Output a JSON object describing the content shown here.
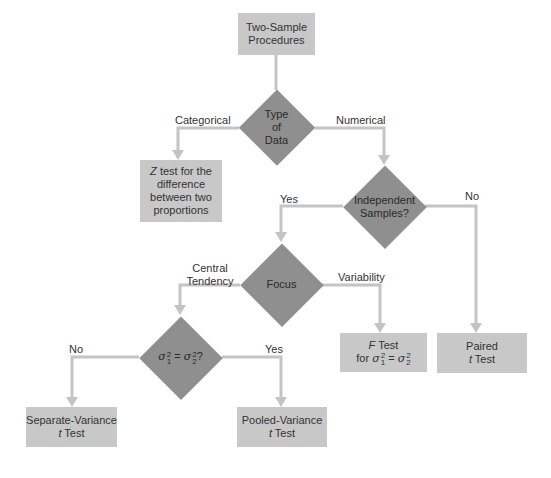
{
  "title": "Two-Sample Procedures",
  "nodes": {
    "start": {
      "label_line1": "Two-Sample",
      "label_line2": "Procedures"
    },
    "type_of_data": {
      "line1": "Type",
      "line2": "of",
      "line3": "Data"
    },
    "z_test": {
      "var": "Z",
      "line1_rest": " test for the",
      "line2": "difference",
      "line3": "between two",
      "line4": "proportions"
    },
    "independent": {
      "line1": "Independent",
      "line2": "Samples?"
    },
    "focus": {
      "label": "Focus"
    },
    "variance_equal": {
      "sigma": "σ",
      "sup": "2",
      "sub1": "1",
      "sub2": "2",
      "eq": " = ",
      "q": "?"
    },
    "f_test": {
      "var": "F",
      "line1_rest": " Test",
      "line2_prefix": "for "
    },
    "paired": {
      "line1": "Paired",
      "var": "t",
      "line2_rest": " Test"
    },
    "separate": {
      "line1": "Separate-Variance",
      "var": "t",
      "line2_rest": " Test"
    },
    "pooled": {
      "line1": "Pooled-Variance",
      "var": "t",
      "line2_rest": " Test"
    }
  },
  "edges": {
    "categorical": "Categorical",
    "numerical": "Numerical",
    "indep_yes": "Yes",
    "indep_no": "No",
    "central_line1": "Central",
    "central_line2": "Tendency",
    "variability": "Variability",
    "var_no": "No",
    "var_yes": "Yes"
  },
  "colors": {
    "box": "#c8c8c8",
    "diamond": "#8f8f8f",
    "connector": "#c4c4c4"
  }
}
